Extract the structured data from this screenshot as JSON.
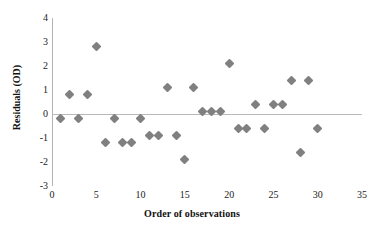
{
  "chart_data": {
    "type": "scatter",
    "title": "",
    "xlabel": "Order of observations",
    "ylabel": "Residuals (OD)",
    "xlim": [
      0,
      35
    ],
    "ylim": [
      -3,
      4
    ],
    "xticks": [
      0,
      5,
      10,
      15,
      20,
      25,
      30,
      35
    ],
    "yticks": [
      -3,
      -2,
      -1,
      0,
      1,
      2,
      3,
      4
    ],
    "xtick_labels": [
      "0",
      "5",
      "10",
      "15",
      "20",
      "25",
      "30",
      "35"
    ],
    "ytick_labels": [
      "-3",
      "-2",
      "-1",
      "0",
      "1",
      "2",
      "3",
      "4"
    ],
    "grid": false,
    "legend": false,
    "zero_line": true,
    "marker_shape": "diamond",
    "marker_color": "#808080",
    "series": [
      {
        "name": "Residuals",
        "x": [
          1,
          2,
          3,
          4,
          5,
          6,
          7,
          8,
          9,
          10,
          11,
          12,
          13,
          14,
          15,
          16,
          17,
          18,
          19,
          20,
          21,
          22,
          23,
          24,
          25,
          26,
          27,
          28,
          29,
          30
        ],
        "y": [
          -0.2,
          0.8,
          -0.2,
          0.8,
          2.8,
          -1.2,
          -0.2,
          -1.2,
          -1.2,
          -0.2,
          -0.9,
          -0.9,
          1.1,
          -0.9,
          -1.9,
          1.1,
          0.1,
          0.1,
          0.1,
          2.1,
          -0.6,
          -0.6,
          0.4,
          -0.6,
          0.4,
          0.4,
          1.4,
          -1.6,
          1.4,
          -0.6
        ]
      }
    ]
  },
  "axes": {
    "x_title": "Order of observations",
    "y_title": "Residuals (OD)"
  }
}
